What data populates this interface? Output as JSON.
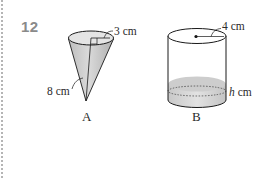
{
  "question": {
    "number": "12"
  },
  "figures": [
    {
      "id": "A",
      "shape": "cone",
      "label": "A",
      "dimensions": {
        "radius_label": "3 cm",
        "height_label": "8 cm"
      }
    },
    {
      "id": "B",
      "shape": "cylinder",
      "label": "B",
      "dimensions": {
        "radius_label": "4 cm",
        "liquid_height_var": "h",
        "liquid_height_unit": " cm"
      }
    }
  ],
  "colors": {
    "question_number": "#8a8a8a",
    "outline": "#1a1a1a",
    "fill_light": "#e6e6e6",
    "fill_mid": "#c9c9c9",
    "liquid": "#cfcfcf",
    "text": "#2a2a2a"
  }
}
